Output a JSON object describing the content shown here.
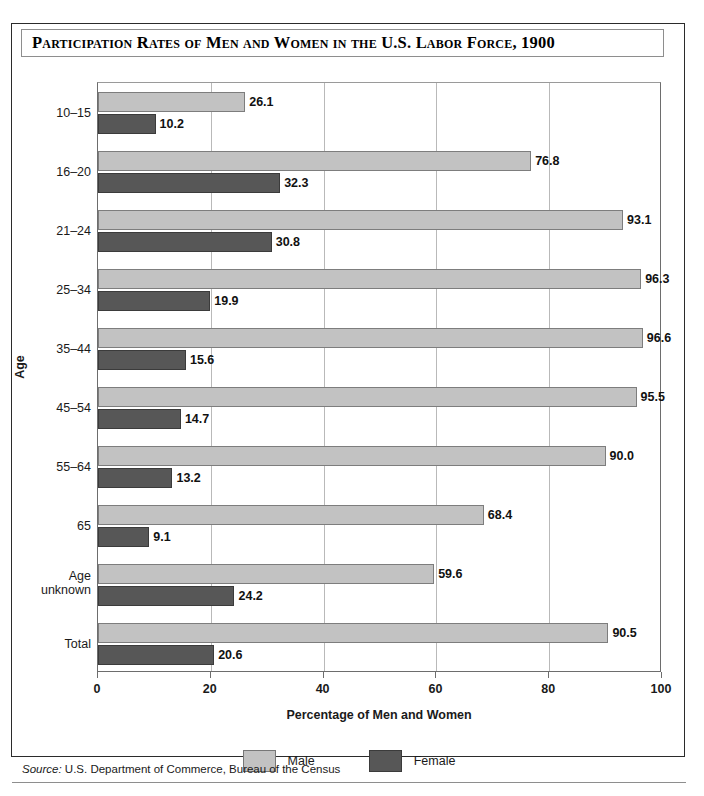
{
  "title": "Participation Rates of Men and Women in the U.S. Labor Force, 1900",
  "source": {
    "keyword": "Source:",
    "text": " U.S. Department of Commerce, Bureau of the Census"
  },
  "legend": {
    "position": "bottom-center",
    "items": [
      {
        "label": "Male",
        "color": "#c2c2c2"
      },
      {
        "label": "Female",
        "color": "#575757"
      }
    ]
  },
  "colors": {
    "male": "#c2c2c2",
    "female": "#575757",
    "grid": "#b9b9b9",
    "axis": "#6d6d6d",
    "frame": "#2b2b2b"
  },
  "axes": {
    "x_title": "Percentage of Men and Women",
    "y_title": "Age",
    "x_ticks": [
      "0",
      "20",
      "40",
      "60",
      "80",
      "100"
    ]
  },
  "chart_data": {
    "type": "bar",
    "orientation": "horizontal",
    "title": "Participation Rates of Men and Women in the U.S. Labor Force, 1900",
    "xlabel": "Percentage of Men and Women",
    "ylabel": "Age",
    "xlim": [
      0,
      100
    ],
    "xticks": [
      0,
      20,
      40,
      60,
      80,
      100
    ],
    "grid": "vertical",
    "legend": [
      "Male",
      "Female"
    ],
    "categories": [
      "10–15",
      "16–20",
      "21–24",
      "25–34",
      "35–44",
      "45–54",
      "55–64",
      "65",
      "Age\nunknown",
      "Total"
    ],
    "series": [
      {
        "name": "Male",
        "color": "#c2c2c2",
        "values": [
          26.1,
          76.8,
          93.1,
          96.3,
          96.6,
          95.5,
          90.0,
          68.4,
          59.6,
          90.5
        ],
        "labels": [
          "26.1",
          "76.8",
          "93.1",
          "96.3",
          "96.6",
          "95.5",
          "90.0",
          "68.4",
          "59.6",
          "90.5"
        ]
      },
      {
        "name": "Female",
        "color": "#575757",
        "values": [
          10.2,
          32.3,
          30.8,
          19.9,
          15.6,
          14.7,
          13.2,
          9.1,
          24.2,
          20.6
        ],
        "labels": [
          "10.2",
          "32.3",
          "30.8",
          "19.9",
          "15.6",
          "14.7",
          "13.2",
          "9.1",
          "24.2",
          "20.6"
        ]
      }
    ]
  }
}
